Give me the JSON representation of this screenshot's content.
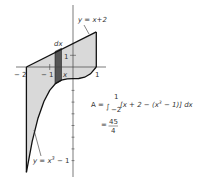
{
  "diagram": {
    "colors": {
      "region_fill": "#d9d9d9",
      "strip_fill": "#555555",
      "curve_stroke": "#111111",
      "axis_stroke": "#444444"
    },
    "curves": {
      "upper_label": "y = x+2",
      "lower_label_prefix": "y = x",
      "lower_label_exp": "3",
      "lower_label_suffix": " − 1"
    },
    "axis_labels": {
      "x_neg2": "− 2",
      "x_neg1": "− 1",
      "x_var": "x",
      "x_pos1": "1",
      "y_pos1": "1"
    },
    "strip_label": "dx",
    "formula": {
      "lhs": "A =",
      "integral": "∫",
      "upper_limit": "1",
      "lower_limit": "−2",
      "integrand_a": "[x + 2 − (x",
      "integrand_exp": "3",
      "integrand_b": " − 1)] dx",
      "eq": "=",
      "numerator": "45",
      "denominator": "4"
    }
  }
}
